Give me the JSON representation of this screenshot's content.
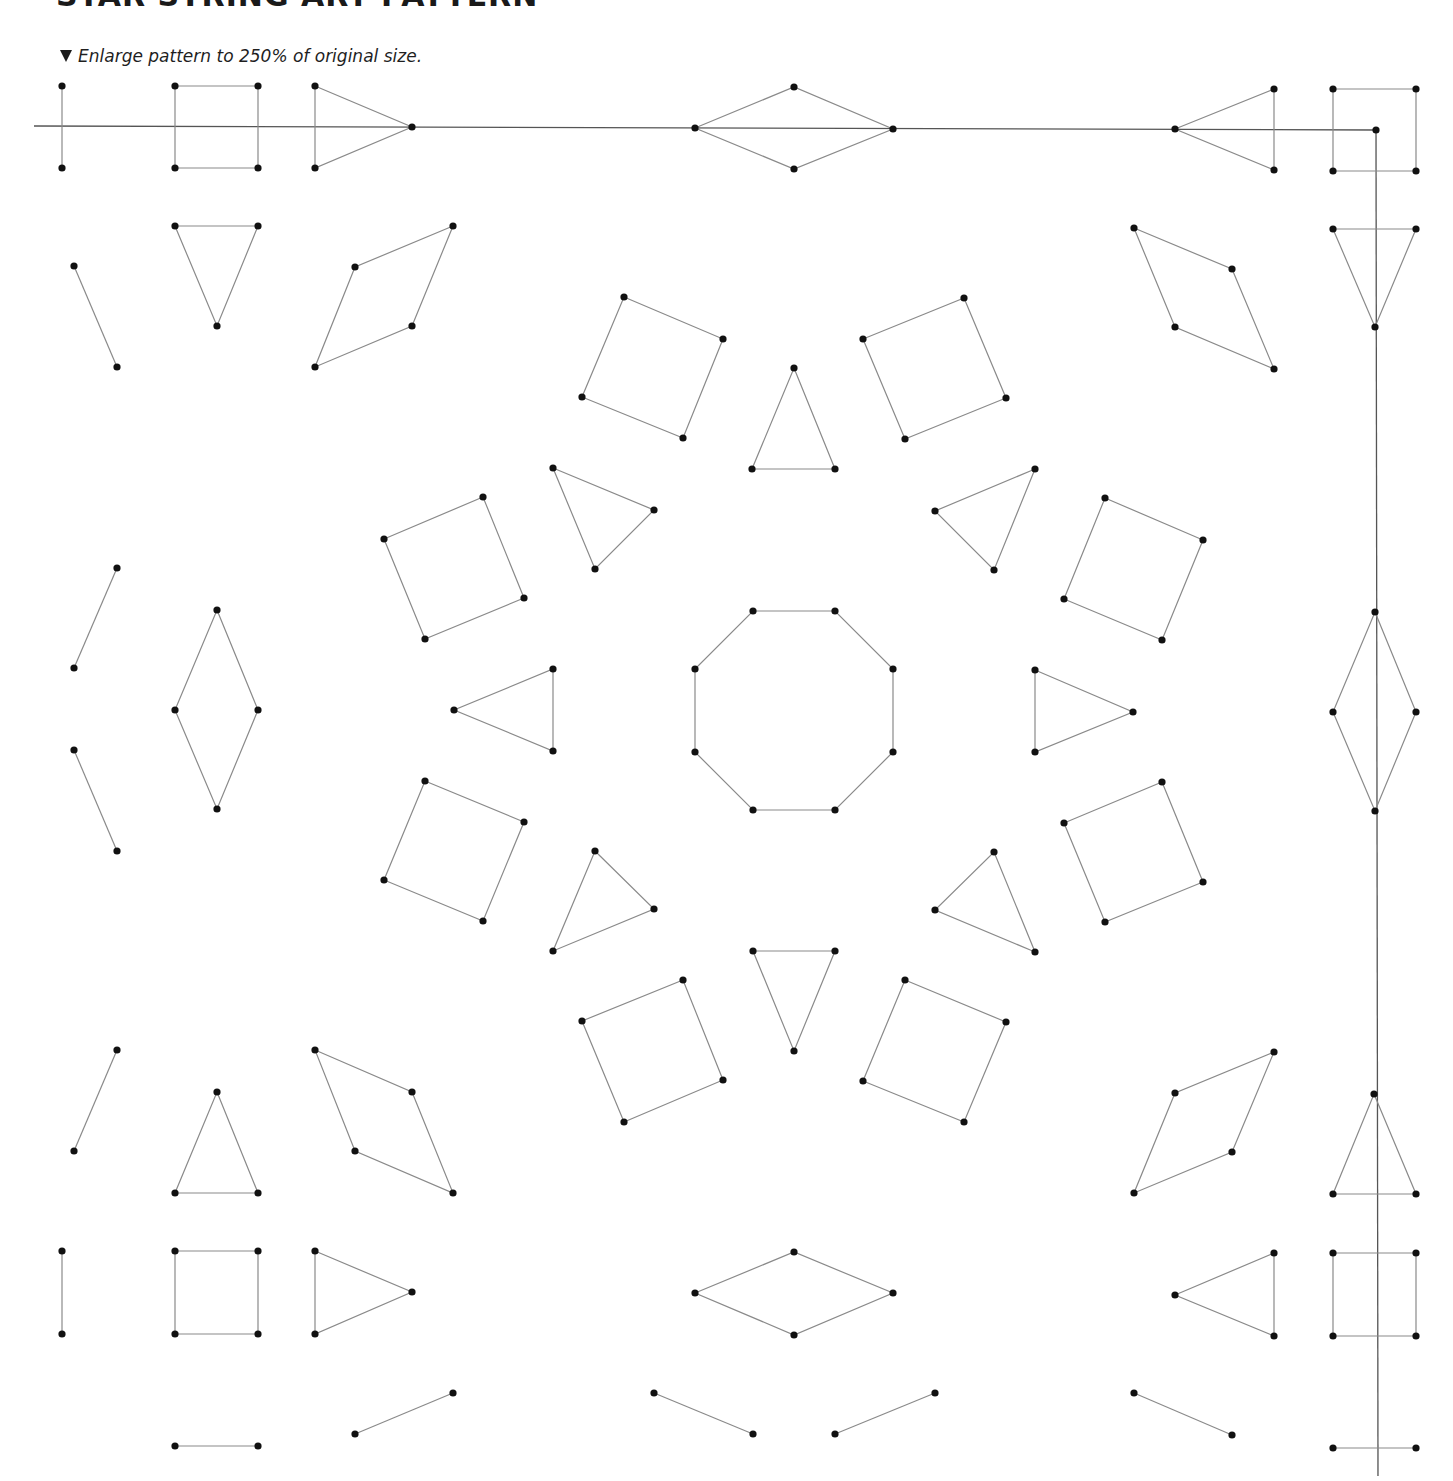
{
  "header": {
    "title": "STAR STRING ART PATTERN",
    "instruction_icon": "down-triangle-icon",
    "instruction": "Enlarge pattern to 250% of original size."
  },
  "pattern": {
    "stroke_color": "#8a8a8a",
    "axis_color": "#555555",
    "dot_color": "#111111",
    "dot_radius": 3.6,
    "axes": [
      {
        "name": "horizontal-guide-line",
        "points": [
          [
            34,
            126
          ],
          [
            1376,
            130
          ]
        ]
      },
      {
        "name": "vertical-guide-line",
        "points": [
          [
            1376,
            130
          ],
          [
            1378,
            1476
          ]
        ]
      }
    ],
    "shapes": [
      {
        "name": "top-left-segment",
        "closed": false,
        "points": [
          [
            62,
            86
          ],
          [
            62,
            168
          ]
        ]
      },
      {
        "name": "top-left-square",
        "closed": true,
        "points": [
          [
            175,
            86
          ],
          [
            258,
            86
          ],
          [
            258,
            168
          ],
          [
            175,
            168
          ]
        ]
      },
      {
        "name": "top-right-pointing-triangle",
        "closed": true,
        "points": [
          [
            315,
            86
          ],
          [
            412,
            127
          ],
          [
            315,
            168
          ]
        ]
      },
      {
        "name": "top-center-diamond",
        "closed": true,
        "points": [
          [
            695,
            128
          ],
          [
            794,
            87
          ],
          [
            893,
            129
          ],
          [
            794,
            169
          ]
        ]
      },
      {
        "name": "top-left-pointing-triangle",
        "closed": true,
        "points": [
          [
            1175,
            129
          ],
          [
            1274,
            89
          ],
          [
            1274,
            170
          ]
        ]
      },
      {
        "name": "top-right-square",
        "closed": true,
        "points": [
          [
            1333,
            89
          ],
          [
            1416,
            89
          ],
          [
            1416,
            171
          ],
          [
            1333,
            171
          ]
        ]
      },
      {
        "name": "corner-dot",
        "closed": false,
        "points": [
          [
            1376,
            130
          ]
        ]
      },
      {
        "name": "left-diagonal-segment-1",
        "closed": false,
        "points": [
          [
            74,
            266
          ],
          [
            117,
            367
          ]
        ]
      },
      {
        "name": "left-down-triangle",
        "closed": true,
        "points": [
          [
            175,
            226
          ],
          [
            258,
            226
          ],
          [
            217,
            326
          ]
        ]
      },
      {
        "name": "left-parallelogram-top",
        "closed": true,
        "points": [
          [
            453,
            226
          ],
          [
            355,
            267
          ],
          [
            315,
            367
          ],
          [
            412,
            326
          ]
        ]
      },
      {
        "name": "right-parallelogram-top",
        "closed": true,
        "points": [
          [
            1134,
            228
          ],
          [
            1232,
            269
          ],
          [
            1274,
            369
          ],
          [
            1175,
            327
          ]
        ]
      },
      {
        "name": "right-down-triangle",
        "closed": true,
        "points": [
          [
            1333,
            229
          ],
          [
            1416,
            229
          ],
          [
            1375,
            327
          ]
        ]
      },
      {
        "name": "ring-square-n-left",
        "closed": true,
        "points": [
          [
            624,
            297
          ],
          [
            723,
            339
          ],
          [
            683,
            438
          ],
          [
            582,
            397
          ]
        ]
      },
      {
        "name": "ring-triangle-n",
        "closed": true,
        "points": [
          [
            794,
            368
          ],
          [
            835,
            469
          ],
          [
            752,
            469
          ]
        ]
      },
      {
        "name": "ring-square-n-right",
        "closed": true,
        "points": [
          [
            964,
            298
          ],
          [
            1006,
            398
          ],
          [
            905,
            439
          ],
          [
            863,
            339
          ]
        ]
      },
      {
        "name": "ring-triangle-nw",
        "closed": true,
        "points": [
          [
            553,
            468
          ],
          [
            654,
            510
          ],
          [
            595,
            569
          ]
        ]
      },
      {
        "name": "ring-triangle-ne",
        "closed": true,
        "points": [
          [
            1035,
            469
          ],
          [
            994,
            570
          ],
          [
            935,
            511
          ]
        ]
      },
      {
        "name": "ring-square-w-upper",
        "closed": true,
        "points": [
          [
            384,
            539
          ],
          [
            483,
            497
          ],
          [
            524,
            598
          ],
          [
            425,
            639
          ]
        ]
      },
      {
        "name": "ring-square-e-upper",
        "closed": true,
        "points": [
          [
            1105,
            498
          ],
          [
            1203,
            540
          ],
          [
            1162,
            640
          ],
          [
            1064,
            599
          ]
        ]
      },
      {
        "name": "left-diagonal-segment-2",
        "closed": false,
        "points": [
          [
            117,
            568
          ],
          [
            74,
            668
          ]
        ]
      },
      {
        "name": "left-diamond",
        "closed": true,
        "points": [
          [
            217,
            610
          ],
          [
            258,
            710
          ],
          [
            217,
            809
          ],
          [
            175,
            710
          ]
        ]
      },
      {
        "name": "left-diagonal-segment-3",
        "closed": false,
        "points": [
          [
            74,
            750
          ],
          [
            117,
            851
          ]
        ]
      },
      {
        "name": "ring-triangle-w",
        "closed": true,
        "points": [
          [
            553,
            669
          ],
          [
            553,
            751
          ],
          [
            454,
            710
          ]
        ]
      },
      {
        "name": "center-octagon",
        "closed": true,
        "points": [
          [
            753,
            611
          ],
          [
            835,
            611
          ],
          [
            893,
            669
          ],
          [
            893,
            752
          ],
          [
            835,
            810
          ],
          [
            753,
            810
          ],
          [
            695,
            752
          ],
          [
            695,
            669
          ]
        ]
      },
      {
        "name": "ring-triangle-e",
        "closed": true,
        "points": [
          [
            1035,
            670
          ],
          [
            1133,
            712
          ],
          [
            1035,
            752
          ]
        ]
      },
      {
        "name": "right-diamond",
        "closed": true,
        "points": [
          [
            1375,
            612
          ],
          [
            1416,
            712
          ],
          [
            1375,
            811
          ],
          [
            1333,
            712
          ]
        ]
      },
      {
        "name": "ring-square-w-lower",
        "closed": true,
        "points": [
          [
            425,
            781
          ],
          [
            524,
            822
          ],
          [
            483,
            921
          ],
          [
            384,
            880
          ]
        ]
      },
      {
        "name": "ring-square-e-lower",
        "closed": true,
        "points": [
          [
            1162,
            782
          ],
          [
            1203,
            882
          ],
          [
            1105,
            922
          ],
          [
            1064,
            823
          ]
        ]
      },
      {
        "name": "ring-triangle-sw",
        "closed": true,
        "points": [
          [
            595,
            851
          ],
          [
            654,
            909
          ],
          [
            553,
            951
          ]
        ]
      },
      {
        "name": "ring-triangle-se",
        "closed": true,
        "points": [
          [
            994,
            852
          ],
          [
            1035,
            952
          ],
          [
            935,
            910
          ]
        ]
      },
      {
        "name": "ring-triangle-s",
        "closed": true,
        "points": [
          [
            753,
            951
          ],
          [
            835,
            951
          ],
          [
            794,
            1051
          ]
        ]
      },
      {
        "name": "ring-square-s-left",
        "closed": true,
        "points": [
          [
            582,
            1021
          ],
          [
            683,
            980
          ],
          [
            723,
            1080
          ],
          [
            624,
            1122
          ]
        ]
      },
      {
        "name": "ring-square-s-right",
        "closed": true,
        "points": [
          [
            905,
            980
          ],
          [
            1006,
            1022
          ],
          [
            964,
            1122
          ],
          [
            863,
            1081
          ]
        ]
      },
      {
        "name": "left-diagonal-segment-4",
        "closed": false,
        "points": [
          [
            117,
            1050
          ],
          [
            74,
            1151
          ]
        ]
      },
      {
        "name": "left-up-triangle",
        "closed": true,
        "points": [
          [
            217,
            1092
          ],
          [
            258,
            1193
          ],
          [
            175,
            1193
          ]
        ]
      },
      {
        "name": "left-parallelogram-bottom",
        "closed": true,
        "points": [
          [
            315,
            1050
          ],
          [
            412,
            1092
          ],
          [
            453,
            1193
          ],
          [
            355,
            1151
          ]
        ]
      },
      {
        "name": "right-parallelogram-bottom",
        "closed": true,
        "points": [
          [
            1274,
            1052
          ],
          [
            1232,
            1152
          ],
          [
            1134,
            1193
          ],
          [
            1175,
            1093
          ]
        ]
      },
      {
        "name": "right-up-triangle",
        "closed": true,
        "points": [
          [
            1374,
            1094
          ],
          [
            1416,
            1194
          ],
          [
            1333,
            1194
          ]
        ]
      },
      {
        "name": "bottom-left-segment",
        "closed": false,
        "points": [
          [
            62,
            1251
          ],
          [
            62,
            1334
          ]
        ]
      },
      {
        "name": "bottom-left-square",
        "closed": true,
        "points": [
          [
            175,
            1251
          ],
          [
            258,
            1251
          ],
          [
            258,
            1334
          ],
          [
            175,
            1334
          ]
        ]
      },
      {
        "name": "bottom-right-pointing-triangle",
        "closed": true,
        "points": [
          [
            315,
            1251
          ],
          [
            412,
            1292
          ],
          [
            315,
            1334
          ]
        ]
      },
      {
        "name": "bottom-center-diamond",
        "closed": true,
        "points": [
          [
            695,
            1293
          ],
          [
            794,
            1252
          ],
          [
            893,
            1293
          ],
          [
            794,
            1335
          ]
        ]
      },
      {
        "name": "bottom-left-pointing-triangle",
        "closed": true,
        "points": [
          [
            1175,
            1295
          ],
          [
            1274,
            1253
          ],
          [
            1274,
            1336
          ]
        ]
      },
      {
        "name": "bottom-right-square",
        "closed": true,
        "points": [
          [
            1333,
            1253
          ],
          [
            1416,
            1253
          ],
          [
            1416,
            1336
          ],
          [
            1333,
            1336
          ]
        ]
      },
      {
        "name": "bottom-horizontal-segment-left",
        "closed": false,
        "points": [
          [
            175,
            1446
          ],
          [
            258,
            1446
          ]
        ]
      },
      {
        "name": "bottom-diagonal-segment-1",
        "closed": false,
        "points": [
          [
            355,
            1434
          ],
          [
            453,
            1393
          ]
        ]
      },
      {
        "name": "bottom-diagonal-segment-2",
        "closed": false,
        "points": [
          [
            654,
            1393
          ],
          [
            753,
            1434
          ]
        ]
      },
      {
        "name": "bottom-diagonal-segment-3",
        "closed": false,
        "points": [
          [
            835,
            1434
          ],
          [
            935,
            1393
          ]
        ]
      },
      {
        "name": "bottom-diagonal-segment-4",
        "closed": false,
        "points": [
          [
            1134,
            1393
          ],
          [
            1232,
            1435
          ]
        ]
      },
      {
        "name": "bottom-horizontal-segment-right",
        "closed": false,
        "points": [
          [
            1333,
            1448
          ],
          [
            1416,
            1448
          ]
        ]
      }
    ]
  }
}
